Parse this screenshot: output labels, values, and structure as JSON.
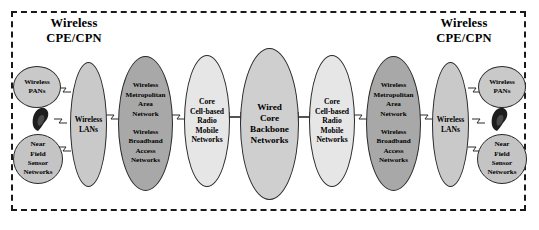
{
  "diagram": {
    "type": "network-architecture",
    "frame_style": "dashed",
    "sections": [
      {
        "id": "cpe-left",
        "title": "Wireless\nCPE/CPN"
      },
      {
        "id": "cpe-right",
        "title": "Wireless\nCPE/CPN"
      }
    ],
    "nodes": [
      {
        "id": "wpan-left",
        "label": "Wireless\nPANs",
        "shape": "ellipse",
        "fill": "#c9c9c9"
      },
      {
        "id": "nfsn-left",
        "label": "Near\nField\nSensor\nNetworks",
        "shape": "ellipse",
        "fill": "#c4c4c4"
      },
      {
        "id": "wlan-left",
        "label": "Wireless\nLANs",
        "shape": "ellipse",
        "fill": "#c9c9c9"
      },
      {
        "id": "wman-left",
        "label_top": "Wireless\nMetropolitan\nArea\nNetwork",
        "label_bottom": "Wireless\nBroadband\nAccess\nNetworks",
        "shape": "ellipse",
        "fill": "#a8a8a8"
      },
      {
        "id": "core-left",
        "label": "Core\nCell-based\nRadio\nMobile\nNetworks",
        "shape": "ellipse",
        "fill": "#e6e6e6"
      },
      {
        "id": "backbone",
        "label": "Wired\nCore\nBackbone\nNetworks",
        "shape": "ellipse",
        "fill": "#cfcfcf"
      },
      {
        "id": "core-right",
        "label": "Core\nCell-based\nRadio\nMobile\nNetworks",
        "shape": "ellipse",
        "fill": "#e6e6e6"
      },
      {
        "id": "wman-right",
        "label_top": "Wireless\nMetropolitan\nArea\nNetwork",
        "label_bottom": "Wireless\nBroadband\nAccess\nNetworks",
        "shape": "ellipse",
        "fill": "#a8a8a8"
      },
      {
        "id": "wlan-right",
        "label": "Wireless\nLANs",
        "shape": "ellipse",
        "fill": "#c9c9c9"
      },
      {
        "id": "wpan-right",
        "label": "Wireless\nPANs",
        "shape": "ellipse",
        "fill": "#c9c9c9"
      },
      {
        "id": "nfsn-right",
        "label": "Near\nField\nSensor\nNetworks",
        "shape": "ellipse",
        "fill": "#c4c4c4"
      }
    ],
    "devices": [
      {
        "id": "handset-left",
        "kind": "mobile-handset"
      },
      {
        "id": "handset-right",
        "kind": "mobile-handset"
      }
    ],
    "links": [
      {
        "from": "wpan-left",
        "to": "wlan-left",
        "kind": "wireless"
      },
      {
        "from": "handset-left",
        "to": "wlan-left",
        "kind": "wireless"
      },
      {
        "from": "nfsn-left",
        "to": "wlan-left",
        "kind": "wireless"
      },
      {
        "from": "wlan-left",
        "to": "wman-left",
        "kind": "wireless"
      },
      {
        "from": "wman-left",
        "to": "core-left",
        "kind": "wireless"
      },
      {
        "from": "core-left",
        "to": "backbone",
        "kind": "wired"
      },
      {
        "from": "backbone",
        "to": "core-right",
        "kind": "wired"
      },
      {
        "from": "core-right",
        "to": "wman-right",
        "kind": "wireless"
      },
      {
        "from": "wman-right",
        "to": "wlan-right",
        "kind": "wireless"
      },
      {
        "from": "wlan-right",
        "to": "wpan-right",
        "kind": "wireless"
      },
      {
        "from": "wlan-right",
        "to": "handset-right",
        "kind": "wireless"
      },
      {
        "from": "wlan-right",
        "to": "nfsn-right",
        "kind": "wireless"
      }
    ],
    "colors": {
      "frame": "#1a1a1a",
      "stroke": "#2a2a2a",
      "text": "#000000",
      "background": "#ffffff"
    }
  }
}
